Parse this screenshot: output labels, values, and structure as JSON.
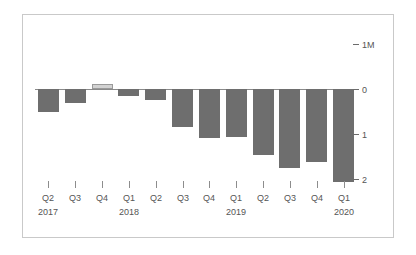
{
  "chart_data": {
    "type": "bar",
    "title": "",
    "subtitle": "",
    "xlabel": "",
    "ylabel": "",
    "ylim": [
      -2.2,
      1.0
    ],
    "grid": false,
    "legend": null,
    "y_ticks": [
      {
        "value": 1,
        "label": "1M"
      },
      {
        "value": 0,
        "label": "0"
      },
      {
        "value": -1,
        "label": "1"
      },
      {
        "value": -2,
        "label": "2"
      }
    ],
    "categories": [
      "Q2",
      "Q3",
      "Q4",
      "Q1",
      "Q2",
      "Q3",
      "Q4",
      "Q1",
      "Q2",
      "Q3",
      "Q4",
      "Q1"
    ],
    "year_labels": [
      {
        "index": 0,
        "label": "2017"
      },
      {
        "index": 3,
        "label": "2018"
      },
      {
        "index": 7,
        "label": "2019"
      },
      {
        "index": 11,
        "label": "2020"
      }
    ],
    "values": [
      -0.51,
      -0.31,
      0.11,
      -0.16,
      -0.25,
      -0.84,
      -1.09,
      -1.07,
      -1.47,
      -1.76,
      -1.62,
      -2.07
    ],
    "colors": {
      "negative_bar": "#6e6e6e",
      "positive_bar": "#d2d2d2",
      "positive_bar_border": "#9a9a9a",
      "axis_line": "#8a8a8a",
      "tick": "#8d8d8d",
      "text": "#555555",
      "card_border": "#c9c9c9",
      "background": "#ffffff"
    }
  }
}
